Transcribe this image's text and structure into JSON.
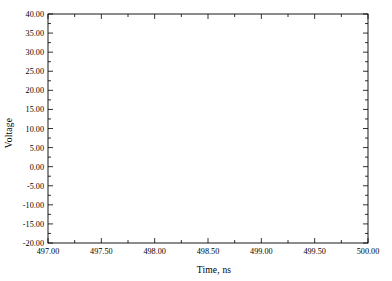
{
  "chart_data": {
    "type": "line",
    "title": "",
    "xlabel": "Time, ns",
    "ylabel": "Voltage",
    "xlim": [
      497.0,
      500.0
    ],
    "ylim": [
      -20.0,
      40.0
    ],
    "grid": false,
    "legend_position": "inline-annotations",
    "frame": "box-all-sides",
    "xticks": [
      497.0,
      497.5,
      498.0,
      498.5,
      499.0,
      499.5,
      500.0
    ],
    "xtick_labels": [
      "497.00",
      "497.50",
      "498.00",
      "498.50",
      "499.00",
      "499.50",
      "500.00"
    ],
    "xminor_step": 0.25,
    "yticks": [
      -20,
      -15,
      -10,
      -5,
      0,
      5,
      10,
      15,
      20,
      25,
      30,
      35,
      40
    ],
    "ytick_labels": [
      "-20.00",
      "-15.00",
      "-10.00",
      "-5.00",
      "0.00",
      "5.00",
      "10.00",
      "15.00",
      "20.00",
      "25.00",
      "30.00",
      "35.00",
      "40.00"
    ],
    "yminor_step": 2.5,
    "period_ns": 1.115,
    "series": [
      {
        "name": "Vc",
        "label_text": "V",
        "label_sub": "c",
        "style": "thin-solid",
        "color": "#3a3a3a",
        "width": 0.8,
        "peak_value": 37.3,
        "min_value": 0.0,
        "glitch_peak": 5.5,
        "peak_times": [
          497.5,
          498.58,
          499.7
        ],
        "min_times": [
          498.05,
          499.15
        ],
        "label_at": {
          "x": 497.38,
          "y": 28.5
        }
      },
      {
        "name": "Vout",
        "label_text": "V",
        "label_sub": "out",
        "style": "thick-solid",
        "color": "#111111",
        "width": 1.7,
        "amplitude": 17.8,
        "offset": 0.0,
        "peak_value": 17.8,
        "min_value": -18.0,
        "peak_times": [
          497.5,
          498.58,
          499.7
        ],
        "min_times": [
          498.05,
          499.15
        ],
        "label_at": {
          "x": 498.72,
          "y": 11.0
        }
      },
      {
        "name": "Vin",
        "label_text": "V",
        "label_sub": "in",
        "style": "dashed",
        "color": "#2a2a2a",
        "width": 0.9,
        "amplitude": 1.5,
        "offset": 0.0,
        "peak_value": 1.5,
        "min_value": -1.6,
        "peak_times": [
          498.05,
          499.15
        ],
        "min_times": [
          497.5,
          498.58,
          499.7
        ],
        "label_at": {
          "x": 497.62,
          "y": -5.2
        }
      }
    ]
  }
}
